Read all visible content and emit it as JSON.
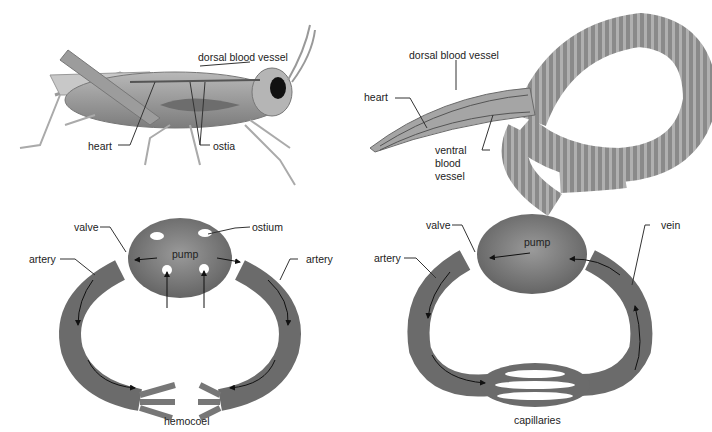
{
  "panels": {
    "grasshopper": {
      "labels": {
        "dorsal": "dorsal blood vessel",
        "heart": "heart",
        "ostia": "ostia"
      }
    },
    "earthworm": {
      "labels": {
        "dorsal": "dorsal blood vessel",
        "heart": "heart",
        "ventral1": "ventral",
        "ventral2": "blood",
        "ventral3": "vessel"
      }
    },
    "open_system": {
      "labels": {
        "valve": "valve",
        "ostium": "ostium",
        "pump": "pump",
        "artery_left": "artery",
        "artery_right": "artery",
        "hemocoel": "hemocoel"
      }
    },
    "closed_system": {
      "labels": {
        "valve": "valve",
        "vein": "vein",
        "pump": "pump",
        "artery": "artery",
        "capillaries": "capillaries"
      }
    }
  },
  "colors": {
    "tissue": "#7a7a7a",
    "tissue_dark": "#555555",
    "tissue_light": "#a8a8a8",
    "line": "#333333"
  }
}
